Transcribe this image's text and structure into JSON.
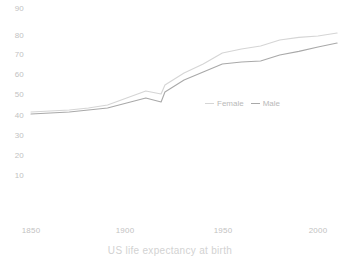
{
  "caption": "US life expectancy at birth",
  "colors": {
    "female_line": "#d5d5d5",
    "male_line": "#a9a9a9",
    "tick_text": "#c2c2c2",
    "caption_text": "#d2d2d2",
    "background": "#ffffff"
  },
  "legend": {
    "position": "inside-right",
    "items": [
      {
        "label": "Female",
        "color": "#d5d5d5"
      },
      {
        "label": "Male",
        "color": "#a9a9a9"
      }
    ]
  },
  "axes": {
    "y_ticks": [
      "90",
      "80",
      "70",
      "60",
      "50",
      "40",
      "30",
      "20",
      "10"
    ],
    "x_ticks": [
      "1850",
      "1900",
      "1950",
      "2000"
    ]
  },
  "chart_data": {
    "type": "line",
    "title": "",
    "subtitle": "",
    "caption": "US life expectancy at birth",
    "xlabel": "",
    "ylabel": "",
    "xlim": [
      1845,
      2012
    ],
    "ylim": [
      0,
      92
    ],
    "grid": false,
    "legend_position": "inside-right",
    "x_ticks": [
      1850,
      1900,
      1950,
      2000
    ],
    "y_ticks": [
      10,
      20,
      30,
      40,
      50,
      60,
      70,
      80,
      90
    ],
    "x": [
      1850,
      1860,
      1870,
      1880,
      1890,
      1900,
      1910,
      1918,
      1920,
      1930,
      1940,
      1950,
      1960,
      1970,
      1980,
      1990,
      2000,
      2010
    ],
    "series": [
      {
        "name": "Female",
        "color": "#d5d5d5",
        "values": [
          41.5,
          42.0,
          42.5,
          43.5,
          45.0,
          48.5,
          52.0,
          50.5,
          55.0,
          61.0,
          65.5,
          71.0,
          73.0,
          74.5,
          77.5,
          78.8,
          79.5,
          81.0
        ]
      },
      {
        "name": "Male",
        "color": "#a9a9a9",
        "values": [
          40.5,
          41.0,
          41.5,
          42.5,
          43.5,
          46.0,
          48.5,
          46.5,
          51.5,
          57.5,
          61.5,
          65.5,
          66.5,
          67.0,
          70.0,
          71.8,
          74.0,
          76.0
        ]
      }
    ]
  }
}
